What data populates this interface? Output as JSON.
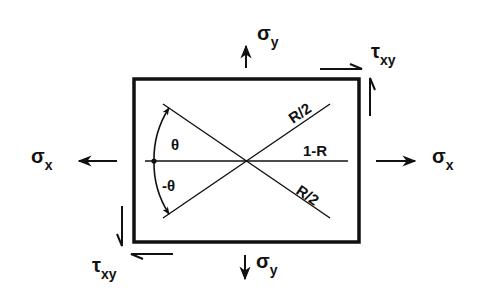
{
  "diagram": {
    "colors": {
      "ink": "#111111",
      "background": "#ffffff"
    },
    "stresses": {
      "sigma_y_top": {
        "symbol": "σ",
        "subscript": "y"
      },
      "sigma_y_bottom": {
        "symbol": "σ",
        "subscript": "y"
      },
      "sigma_x_left": {
        "symbol": "σ",
        "subscript": "x"
      },
      "sigma_x_right": {
        "symbol": "σ",
        "subscript": "x"
      },
      "tau_xy_top_right": {
        "symbol": "τ",
        "subscript": "xy"
      },
      "tau_xy_bottom_left": {
        "symbol": "τ",
        "subscript": "xy"
      }
    },
    "lines": {
      "upper_diagonal_label": "R/2",
      "horizontal_label": "1-R",
      "lower_diagonal_label": "R/2"
    },
    "angles": {
      "upper": "θ",
      "lower": "-θ"
    }
  }
}
